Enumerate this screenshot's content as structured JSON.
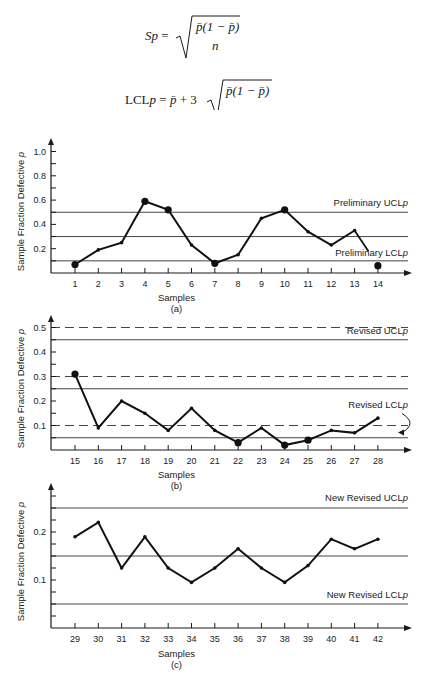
{
  "formulas": {
    "sp": {
      "lhs": "Sp =",
      "numerator": "p̄(1 − p̄)",
      "denominator": "n"
    },
    "lcl": {
      "lhs": "LCLp = p̄ + 3",
      "numerator": "p̄(1 − p̄)",
      "denominator": "n"
    }
  },
  "chart_data": [
    {
      "type": "line",
      "panel": "(a)",
      "xlabel": "Samples",
      "ylabel": "Sample Fraction Defective p",
      "categories": [
        1,
        2,
        3,
        4,
        5,
        6,
        7,
        8,
        9,
        10,
        11,
        12,
        13,
        14
      ],
      "values": [
        0.07,
        0.19,
        0.25,
        0.59,
        0.52,
        0.23,
        0.08,
        0.15,
        0.45,
        0.52,
        0.34,
        0.23,
        0.35,
        0.06
      ],
      "yticks": [
        0.2,
        0.4,
        0.6,
        0.8,
        1.0
      ],
      "ytick_labels": [
        "0.2",
        "0.4",
        "0.6",
        "0.8",
        "1.0"
      ],
      "ylim": [
        0,
        1.05
      ],
      "control_lines": [
        {
          "value": 0.5,
          "style": "solid",
          "label": "Preliminary UCLp"
        },
        {
          "value": 0.3,
          "style": "solid",
          "label": ""
        },
        {
          "value": 0.1,
          "style": "solid",
          "label": "Preliminary LCLp"
        }
      ],
      "highlighted_points": [
        1,
        4,
        5,
        7,
        10,
        14
      ]
    },
    {
      "type": "line",
      "panel": "(b)",
      "xlabel": "Samples",
      "ylabel": "Sample Fraction Defective p",
      "categories": [
        15,
        16,
        17,
        18,
        19,
        20,
        21,
        22,
        23,
        24,
        25,
        26,
        27,
        28
      ],
      "values": [
        0.31,
        0.09,
        0.2,
        0.15,
        0.08,
        0.17,
        0.08,
        0.03,
        0.09,
        0.02,
        0.04,
        0.08,
        0.07,
        0.13
      ],
      "yticks": [
        0.1,
        0.2,
        0.3,
        0.4,
        0.5
      ],
      "ytick_labels": [
        "0.1",
        "0.2",
        "0.3",
        "0.4",
        "0.5"
      ],
      "ylim": [
        0,
        0.55
      ],
      "control_lines": [
        {
          "value": 0.5,
          "style": "dashed",
          "label": ""
        },
        {
          "value": 0.45,
          "style": "solid",
          "label": "Revised UCLp"
        },
        {
          "value": 0.3,
          "style": "dashed",
          "label": ""
        },
        {
          "value": 0.25,
          "style": "solid",
          "label": ""
        },
        {
          "value": 0.1,
          "style": "dashed",
          "label": "Revised LCLp"
        },
        {
          "value": 0.05,
          "style": "solid",
          "label": ""
        }
      ],
      "highlighted_points": [
        15,
        22,
        24,
        25
      ]
    },
    {
      "type": "line",
      "panel": "(c)",
      "xlabel": "Samples",
      "ylabel": "Sample Fraction Defective p",
      "categories": [
        29,
        30,
        31,
        32,
        33,
        34,
        35,
        36,
        37,
        38,
        39,
        40,
        41,
        42
      ],
      "values": [
        0.19,
        0.22,
        0.125,
        0.19,
        0.125,
        0.095,
        0.125,
        0.165,
        0.125,
        0.095,
        0.13,
        0.185,
        0.165,
        0.185
      ],
      "yticks": [
        0.1,
        0.2
      ],
      "ytick_labels": [
        "0.1",
        "0.2"
      ],
      "ylim": [
        0,
        0.3
      ],
      "control_lines": [
        {
          "value": 0.25,
          "style": "solid",
          "label": "New Revised UCLp"
        },
        {
          "value": 0.15,
          "style": "solid",
          "label": ""
        },
        {
          "value": 0.05,
          "style": "solid",
          "label": "New Revised LCLp"
        }
      ],
      "highlighted_points": []
    }
  ],
  "labels": {
    "a": {
      "xlabel": "Samples",
      "panel": "(a)",
      "ylabel": "Sample Fraction Defective p",
      "ucl": "Preliminary UCLp",
      "lcl": "Preliminary LCLp"
    },
    "b": {
      "xlabel": "Samples",
      "panel": "(b)",
      "ylabel": "Sample Fraction Defective p",
      "ucl": "Revised UCLp",
      "lcl": "Revised LCLp"
    },
    "c": {
      "xlabel": "Samples",
      "panel": "(c)",
      "ylabel": "Sample Fraction Defective p",
      "ucl": "New Revised UCLp",
      "lcl": "New Revised LCLp"
    }
  },
  "colors": {
    "ink": "#1a1a1a",
    "grid": "#444444",
    "background": "#ffffff"
  }
}
